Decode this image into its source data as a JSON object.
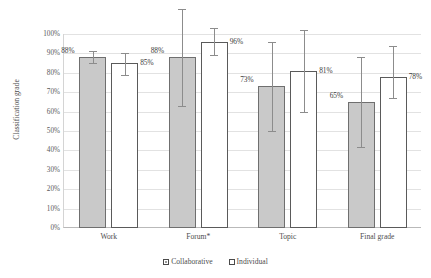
{
  "chart_data": {
    "type": "bar",
    "title": "",
    "xlabel": "",
    "ylabel": "Classification grade",
    "ylim": [
      0,
      100
    ],
    "ytick_labels": [
      "100%",
      "90%",
      "80%",
      "70%",
      "60%",
      "50%",
      "40%",
      "30%",
      "20%",
      "10%",
      "0%"
    ],
    "ytick_values": [
      100,
      90,
      80,
      70,
      60,
      50,
      40,
      30,
      20,
      10,
      0
    ],
    "grid": true,
    "legend_position": "bottom",
    "categories": [
      "Work",
      "Forum*",
      "Topic",
      "Final grade"
    ],
    "series": [
      {
        "name": "Collaborative",
        "color": "#c9c9c9",
        "values": [
          88,
          88,
          73,
          65
        ],
        "value_labels": [
          "88%",
          "88%",
          "73%",
          "65%"
        ],
        "error_low": [
          85,
          63,
          50,
          42
        ],
        "error_high": [
          91,
          113,
          96,
          88
        ]
      },
      {
        "name": "Individual",
        "color": "#ffffff",
        "values": [
          85,
          96,
          81,
          78
        ],
        "value_labels": [
          "85%",
          "96%",
          "81%",
          "78%"
        ],
        "error_low": [
          79,
          89,
          60,
          67
        ],
        "error_high": [
          90,
          103,
          102,
          94
        ]
      }
    ]
  },
  "legend": {
    "items": [
      {
        "label": "Collaborative",
        "swatch": "filled-gray-square-icon"
      },
      {
        "label": "Individual",
        "swatch": "outline-white-square-icon"
      }
    ]
  },
  "axis": {
    "y_title": "Classification grade"
  }
}
